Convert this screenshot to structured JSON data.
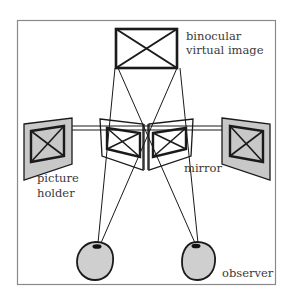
{
  "diagram": {
    "labels": {
      "virtual_image_line1": "binocular",
      "virtual_image_line2": "virtual image",
      "picture_holder_line1": "picture",
      "picture_holder_line2": "holder",
      "mirror": "mirror",
      "observer": "observer"
    },
    "colors": {
      "stroke": "#1a1a1a",
      "frame": "#8a8a8a",
      "holder_fill": "#c8c8c8",
      "eye_fill": "#cfcfcf",
      "label": "#3a3a3a"
    },
    "components": [
      "binocular virtual image",
      "left picture holder",
      "right picture holder",
      "left mirror",
      "right mirror",
      "left eye",
      "right eye"
    ]
  }
}
